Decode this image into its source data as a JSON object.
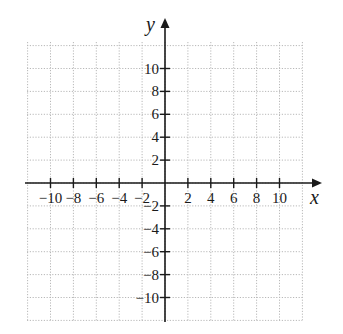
{
  "chart_data": {
    "type": "scatter",
    "title": "",
    "xlabel": "x",
    "ylabel": "y",
    "xlim": [
      -12,
      12
    ],
    "ylim": [
      -12,
      12
    ],
    "grid": true,
    "grid_step": 2,
    "x_ticks": [
      -10,
      -8,
      -6,
      -4,
      -2,
      2,
      4,
      6,
      8,
      10
    ],
    "y_ticks": [
      -10,
      -8,
      -6,
      -4,
      -2,
      2,
      4,
      6,
      8,
      10
    ],
    "x_tick_labels": [
      "−10",
      "−8",
      "−6",
      "−4",
      "−2",
      "2",
      "4",
      "6",
      "8",
      "10"
    ],
    "y_tick_labels": [
      "−10",
      "−8",
      "−6",
      "−4",
      "−2",
      "2",
      "4",
      "6",
      "8",
      "10"
    ],
    "series": [],
    "colors": {
      "axis": "#1a1a1a",
      "grid": "#b8b8b8",
      "background": "#ffffff"
    }
  },
  "layout": {
    "origin_px": [
      165,
      183
    ],
    "unit_px": 11.45,
    "grid_px": {
      "left": 27,
      "right": 302,
      "top": 42,
      "bottom": 322
    },
    "x_axis_end_px": 322,
    "y_axis_top_px": 18
  },
  "labels": {
    "x_axis": "x",
    "y_axis": "y"
  }
}
